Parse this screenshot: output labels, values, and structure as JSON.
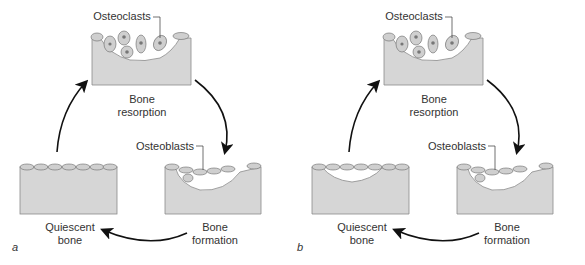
{
  "figure": {
    "colors": {
      "bone": "#d6d6d6",
      "bone_edge": "#8a8a8a",
      "cell": "#cfcfcf",
      "line": "#111111"
    },
    "panels": [
      {
        "id": "a",
        "panel_label": "a",
        "stages": {
          "resorption": {
            "label_line1": "Bone",
            "label_line2": "resorption",
            "callout": "Osteoclasts"
          },
          "formation": {
            "label_line1": "Bone",
            "label_line2": "formation",
            "callout": "Osteoblasts"
          },
          "quiescent": {
            "label_line1": "Quiescent",
            "label_line2": "bone"
          }
        }
      },
      {
        "id": "b",
        "panel_label": "b",
        "stages": {
          "resorption": {
            "label_line1": "Bone",
            "label_line2": "resorption",
            "callout": "Osteoclasts"
          },
          "formation": {
            "label_line1": "Bone",
            "label_line2": "formation",
            "callout": "Osteoblasts"
          },
          "quiescent": {
            "label_line1": "Quiescent",
            "label_line2": "bone"
          }
        }
      }
    ]
  }
}
